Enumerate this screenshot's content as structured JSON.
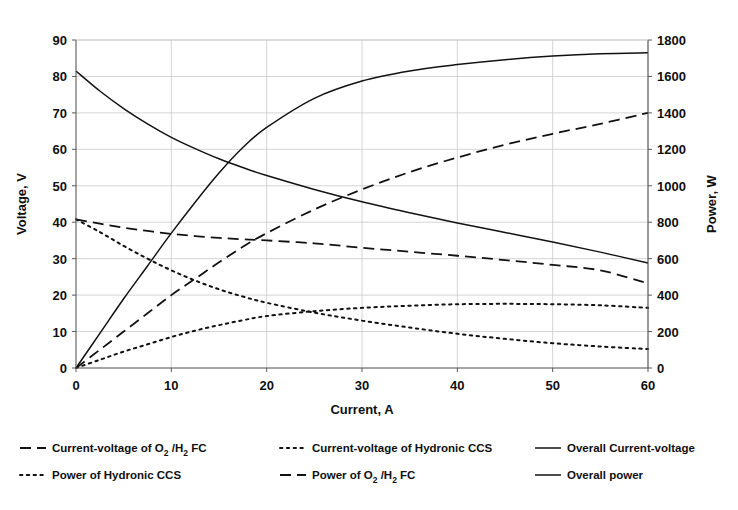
{
  "figure": {
    "clipped_title_fragment": "",
    "background": "#ffffff",
    "line_color": "#121212",
    "grid_color": "#c9c9c9",
    "axis_color": "#4a4a4a"
  },
  "axes": {
    "x": {
      "label": "Current, A",
      "ticks": [
        0,
        10,
        20,
        30,
        40,
        50,
        60
      ],
      "min": 0,
      "max": 60
    },
    "y_left": {
      "label": "Voltage, V",
      "ticks": [
        0,
        10,
        20,
        30,
        40,
        50,
        60,
        70,
        80,
        90
      ],
      "min": 0,
      "max": 90
    },
    "y_right": {
      "label": "Power, W",
      "ticks": [
        0,
        200,
        400,
        600,
        800,
        1000,
        1200,
        1400,
        1600,
        1800
      ],
      "min": 0,
      "max": 1800
    }
  },
  "legend": {
    "entries": [
      {
        "label_pre": "Current-voltage of O",
        "sub1": "2",
        "mid": " /H",
        "sub2": "2",
        "label_post": " FC",
        "style": "dashed",
        "axis": "left",
        "col": 0,
        "row": 0
      },
      {
        "label_pre": "Current-voltage of Hydronic CCS",
        "sub1": "",
        "mid": "",
        "sub2": "",
        "label_post": "",
        "style": "dotted",
        "axis": "left",
        "col": 1,
        "row": 0
      },
      {
        "label_pre": "Overall Current-voltage",
        "sub1": "",
        "mid": "",
        "sub2": "",
        "label_post": "",
        "style": "solid",
        "axis": "left",
        "col": 2,
        "row": 0
      },
      {
        "label_pre": "Power of Hydronic CCS",
        "sub1": "",
        "mid": "",
        "sub2": "",
        "label_post": "",
        "style": "dotted",
        "axis": "right",
        "col": 0,
        "row": 1
      },
      {
        "label_pre": "Power of O",
        "sub1": "2",
        "mid": " /H",
        "sub2": "2",
        "label_post": " FC",
        "style": "dashed",
        "axis": "right",
        "col": 1,
        "row": 1
      },
      {
        "label_pre": "Overall power",
        "sub1": "",
        "mid": "",
        "sub2": "",
        "label_post": "",
        "style": "solid",
        "axis": "right",
        "col": 2,
        "row": 1
      }
    ]
  },
  "chart_data": {
    "type": "line",
    "title": "",
    "xlabel": "Current, A",
    "ylabel": "Voltage, V",
    "ylabel_secondary": "Power, W",
    "xlim": [
      0,
      60
    ],
    "ylim": [
      0,
      90
    ],
    "ylim_secondary": [
      0,
      1800
    ],
    "grid": true,
    "legend_position": "below",
    "x": [
      0,
      2.5,
      5,
      7.5,
      10,
      12.5,
      15,
      17.5,
      20,
      25,
      30,
      35,
      40,
      45,
      50,
      55,
      60
    ],
    "series": [
      {
        "name": "Overall Current-voltage",
        "style": "solid",
        "axis": "left",
        "unit": "V",
        "values": [
          81.5,
          76.0,
          71.2,
          67.0,
          63.3,
          60.2,
          57.4,
          55.0,
          52.8,
          49.0,
          45.6,
          42.6,
          39.8,
          37.2,
          34.6,
          31.8,
          28.8
        ]
      },
      {
        "name": "Current-voltage of O2/H2 FC",
        "style": "dashed",
        "axis": "left",
        "unit": "V",
        "values": [
          40.8,
          39.6,
          38.5,
          37.6,
          36.8,
          36.2,
          35.7,
          35.3,
          35.0,
          34.2,
          33.0,
          31.9,
          30.8,
          29.6,
          28.3,
          26.8,
          23.2
        ]
      },
      {
        "name": "Current-voltage of Hydronic CCS",
        "style": "dotted",
        "axis": "left",
        "unit": "V",
        "values": [
          40.8,
          37.3,
          33.5,
          30.0,
          26.8,
          24.0,
          21.6,
          19.6,
          17.9,
          15.2,
          13.0,
          11.1,
          9.4,
          8.0,
          6.8,
          5.9,
          5.2
        ]
      },
      {
        "name": "Overall power",
        "style": "solid",
        "axis": "right",
        "unit": "W",
        "values": [
          0,
          190,
          380,
          560,
          740,
          910,
          1070,
          1210,
          1320,
          1480,
          1575,
          1630,
          1665,
          1692,
          1712,
          1725,
          1730
        ]
      },
      {
        "name": "Power of O2/H2 FC",
        "style": "dashed",
        "axis": "right",
        "unit": "W",
        "values": [
          0,
          100,
          200,
          300,
          400,
          490,
          580,
          665,
          740,
          870,
          980,
          1075,
          1155,
          1225,
          1285,
          1340,
          1400
        ]
      },
      {
        "name": "Power of Hydronic CCS",
        "style": "dotted",
        "axis": "right",
        "unit": "W",
        "values": [
          0,
          45,
          90,
          130,
          170,
          205,
          235,
          262,
          285,
          312,
          330,
          342,
          350,
          352,
          350,
          344,
          330
        ]
      }
    ]
  }
}
